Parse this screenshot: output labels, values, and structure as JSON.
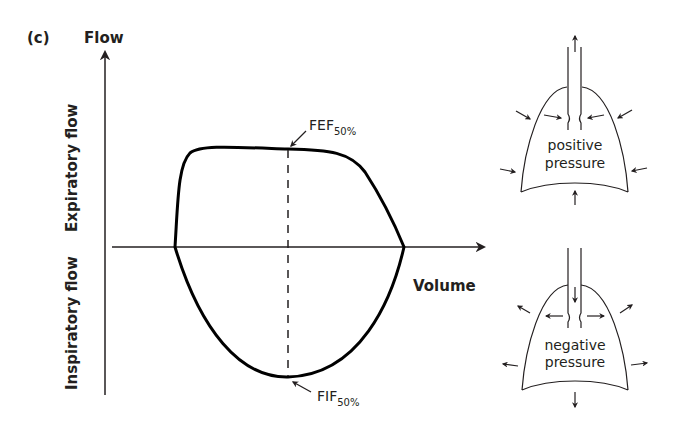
{
  "panel_label": "(c)",
  "axes": {
    "y_label": "Flow",
    "x_label": "Volume",
    "upper_label": "Expiratory flow",
    "lower_label": "Inspiratory flow"
  },
  "annotations": {
    "fef": {
      "main": "FEF",
      "sub": "50%"
    },
    "fif": {
      "main": "FIF",
      "sub": "50%"
    }
  },
  "lungs": {
    "top": {
      "line1": "positive",
      "line2": "pressure"
    },
    "bottom": {
      "line1": "negative",
      "line2": "pressure"
    }
  },
  "colors": {
    "ink": "#231f20",
    "background": "#ffffff"
  }
}
